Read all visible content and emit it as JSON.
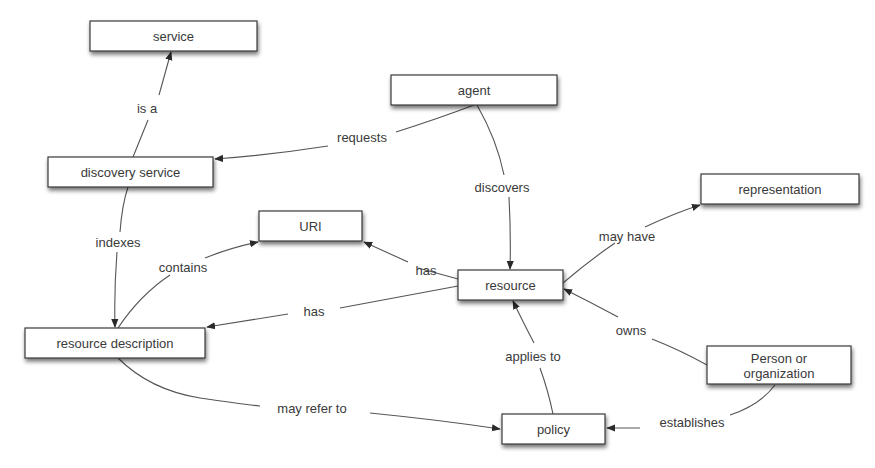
{
  "diagram": {
    "type": "concept-map",
    "nodes": {
      "service": {
        "label": "service",
        "x": 90,
        "y": 21,
        "w": 167,
        "h": 30
      },
      "agent": {
        "label": "agent",
        "x": 391,
        "y": 75,
        "w": 166,
        "h": 30
      },
      "discovery_service": {
        "label": "discovery service",
        "x": 48,
        "y": 157,
        "w": 165,
        "h": 30
      },
      "uri": {
        "label": "URI",
        "x": 259,
        "y": 211,
        "w": 103,
        "h": 30
      },
      "resource": {
        "label": "resource",
        "x": 458,
        "y": 270,
        "w": 105,
        "h": 30
      },
      "representation": {
        "label": "representation",
        "x": 701,
        "y": 174,
        "w": 158,
        "h": 30
      },
      "resource_description": {
        "label": "resource description",
        "x": 25,
        "y": 328,
        "w": 180,
        "h": 30
      },
      "person_or_organization": {
        "label_line1": "Person or",
        "label_line2": "organization",
        "x": 707,
        "y": 346,
        "w": 144,
        "h": 38
      },
      "policy": {
        "label": "policy",
        "x": 502,
        "y": 414,
        "w": 103,
        "h": 30
      }
    },
    "edges": [
      {
        "id": "is_a",
        "from": "discovery service",
        "to": "service",
        "label": "is a"
      },
      {
        "id": "requests",
        "from": "agent",
        "to": "discovery service",
        "label": "requests"
      },
      {
        "id": "discovers",
        "from": "agent",
        "to": "resource",
        "label": "discovers"
      },
      {
        "id": "indexes",
        "from": "discovery service",
        "to": "resource description",
        "label": "indexes"
      },
      {
        "id": "contains",
        "from": "resource description",
        "to": "URI",
        "label": "contains"
      },
      {
        "id": "has_uri",
        "from": "resource",
        "to": "URI",
        "label": "has"
      },
      {
        "id": "has_description",
        "from": "resource",
        "to": "resource description",
        "label": "has"
      },
      {
        "id": "may_have",
        "from": "resource",
        "to": "representation",
        "label": "may have"
      },
      {
        "id": "owns",
        "from": "Person or organization",
        "to": "resource",
        "label": "owns"
      },
      {
        "id": "applies_to",
        "from": "policy",
        "to": "resource",
        "label": "applies to"
      },
      {
        "id": "may_refer_to",
        "from": "resource description",
        "to": "policy",
        "label": "may refer to"
      },
      {
        "id": "establishes",
        "from": "Person or organization",
        "to": "policy",
        "label": "establishes"
      }
    ],
    "colors": {
      "node_border": "#3a3a3a",
      "node_fill": "#ffffff",
      "edge": "#555555",
      "text": "#3a3a3a",
      "background": "#ffffff"
    }
  }
}
